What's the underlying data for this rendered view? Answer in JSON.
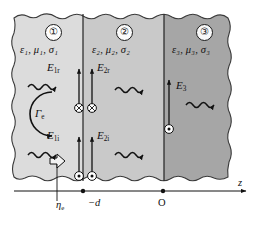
{
  "figure": {
    "axis": {
      "name": "z",
      "label": "z",
      "ticks": [
        {
          "name": "interface-minus-d",
          "label": "−d",
          "x": 82
        },
        {
          "name": "origin",
          "label": "O",
          "x": 163
        }
      ],
      "arrow_label": "z"
    },
    "regions": [
      {
        "id": "region-1",
        "number": "①",
        "params": "ε₁, μ₁, σ₁",
        "eps": "ε",
        "eps_sub": "1",
        "mu": "μ",
        "mu_sub": "1",
        "sigma": "σ",
        "sigma_sub": "1",
        "fill": "#dcdcdc"
      },
      {
        "id": "region-2",
        "number": "②",
        "params": "ε₂, μ₂, σ₂",
        "eps": "ε",
        "eps_sub": "2",
        "mu": "μ",
        "mu_sub": "2",
        "sigma": "σ",
        "sigma_sub": "2",
        "fill": "#c9c9c9"
      },
      {
        "id": "region-3",
        "number": "③",
        "params": "ε₃, μ₃, σ₃",
        "eps": "ε",
        "eps_sub": "3",
        "mu": "μ",
        "mu_sub": "3",
        "sigma": "σ",
        "sigma_sub": "3",
        "fill": "#a6a6a6"
      }
    ],
    "fields": [
      {
        "id": "field-E1r",
        "symbol": "E",
        "sub": "1r",
        "marker": "cross",
        "direction": "up"
      },
      {
        "id": "field-E2r",
        "symbol": "E",
        "sub": "2r",
        "marker": "cross",
        "direction": "up"
      },
      {
        "id": "field-E1i",
        "symbol": "E",
        "sub": "1i",
        "marker": "dot",
        "direction": "up"
      },
      {
        "id": "field-E2i",
        "symbol": "E",
        "sub": "2i",
        "marker": "dot",
        "direction": "up"
      },
      {
        "id": "field-E3",
        "symbol": "E",
        "sub": "3",
        "marker": "dot",
        "direction": "up"
      }
    ],
    "annotations": [
      {
        "id": "reflection-coefficient",
        "symbol": "Γ",
        "sub": "e",
        "label": "Γe"
      },
      {
        "id": "intrinsic-impedance",
        "symbol": "η",
        "sub": "e",
        "label": "ηe"
      }
    ],
    "colors": {
      "region1_fill": "#dcdcdc",
      "region2_fill": "#c9c9c9",
      "region3_fill": "#a6a6a6",
      "outline": "#3a3a3a",
      "ink": "#111111",
      "background": "#ffffff"
    }
  }
}
